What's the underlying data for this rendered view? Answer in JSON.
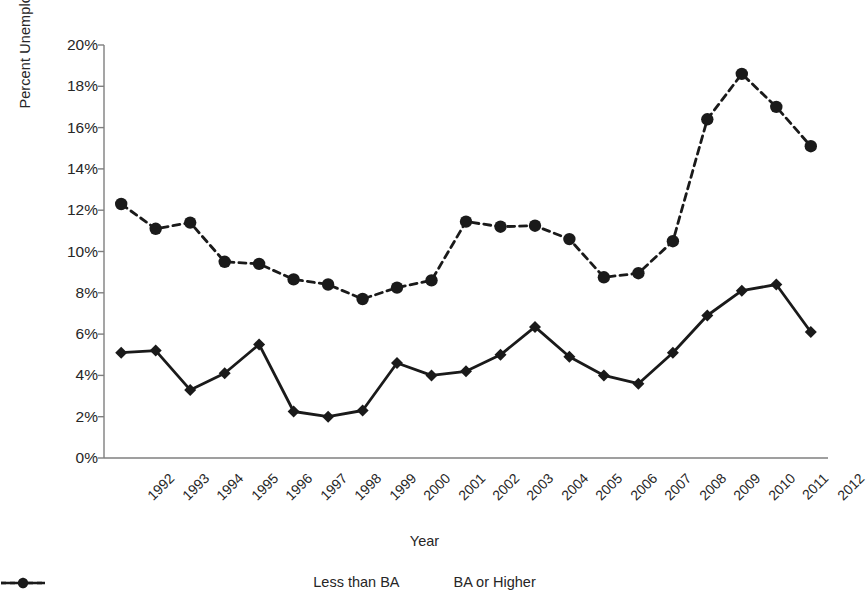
{
  "chart_data": {
    "type": "line",
    "title": "",
    "xlabel": "Year",
    "ylabel": "Percent Unemployed",
    "categories": [
      "1992",
      "1993",
      "1994",
      "1995",
      "1996",
      "1997",
      "1998",
      "1999",
      "2000",
      "2001",
      "2002",
      "2003",
      "2004",
      "2005",
      "2006",
      "2007",
      "2008",
      "2009",
      "2010",
      "2011",
      "2012"
    ],
    "ylim": [
      0,
      20
    ],
    "ytick_labels": [
      "0%",
      "2%",
      "4%",
      "6%",
      "8%",
      "10%",
      "12%",
      "14%",
      "16%",
      "18%",
      "20%"
    ],
    "ytick_values": [
      0,
      2,
      4,
      6,
      8,
      10,
      12,
      14,
      16,
      18,
      20
    ],
    "grid": false,
    "legend_position": "bottom",
    "series": [
      {
        "name": "Less than BA",
        "line_style": "dashed",
        "marker": "circle",
        "color": "#1a1a1a",
        "values": [
          12.3,
          11.1,
          11.4,
          9.5,
          9.4,
          8.65,
          8.4,
          7.7,
          8.25,
          8.6,
          11.45,
          11.2,
          11.25,
          10.6,
          8.75,
          8.95,
          10.5,
          16.4,
          18.6,
          17.0,
          15.1
        ]
      },
      {
        "name": "BA or Higher",
        "line_style": "solid",
        "marker": "diamond",
        "color": "#1a1a1a",
        "values": [
          5.1,
          5.2,
          3.3,
          4.1,
          5.5,
          2.25,
          2.0,
          2.3,
          4.6,
          4.0,
          4.2,
          5.0,
          6.35,
          4.9,
          4.0,
          3.6,
          5.1,
          6.9,
          8.1,
          8.4,
          6.1
        ]
      }
    ]
  },
  "legend": {
    "items": [
      {
        "label": "Less than BA",
        "style": "dashed-circle"
      },
      {
        "label": "BA or Higher",
        "style": "solid-diamond"
      }
    ]
  },
  "axes": {
    "x_title": "Year",
    "y_title": "Percent Unemployed"
  }
}
